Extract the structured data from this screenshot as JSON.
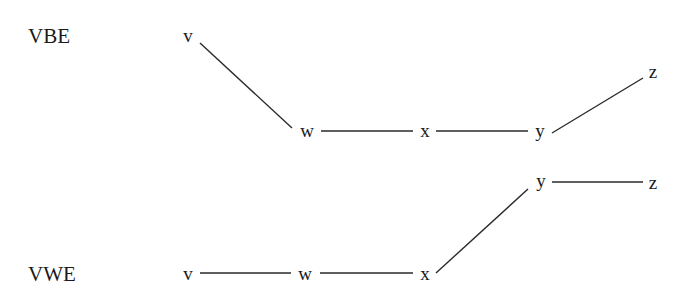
{
  "rows": [
    {
      "id": "vbe",
      "label": "VBE",
      "label_pos": {
        "x": 28,
        "y": 43
      },
      "nodes": [
        {
          "id": "v",
          "label": "v",
          "x": 188,
          "y": 42
        },
        {
          "id": "w",
          "label": "w",
          "x": 307,
          "y": 137
        },
        {
          "id": "x",
          "label": "x",
          "x": 425,
          "y": 137
        },
        {
          "id": "y",
          "label": "y",
          "x": 540,
          "y": 137
        },
        {
          "id": "z",
          "label": "z",
          "x": 653,
          "y": 78
        }
      ],
      "edges": [
        {
          "from": "v",
          "to": "w",
          "x1": 200,
          "y1": 43,
          "x2": 292,
          "y2": 128
        },
        {
          "from": "w",
          "to": "x",
          "x1": 321,
          "y1": 131,
          "x2": 413,
          "y2": 131
        },
        {
          "from": "x",
          "to": "y",
          "x1": 436,
          "y1": 131,
          "x2": 528,
          "y2": 131
        },
        {
          "from": "y",
          "to": "z",
          "x1": 552,
          "y1": 133,
          "x2": 643,
          "y2": 78
        }
      ]
    },
    {
      "id": "vwe",
      "label": "VWE",
      "label_pos": {
        "x": 28,
        "y": 281
      },
      "nodes": [
        {
          "id": "v",
          "label": "v",
          "x": 188,
          "y": 280
        },
        {
          "id": "w",
          "label": "w",
          "x": 305,
          "y": 280
        },
        {
          "id": "x",
          "label": "x",
          "x": 425,
          "y": 280
        },
        {
          "id": "y",
          "label": "y",
          "x": 541,
          "y": 187
        },
        {
          "id": "z",
          "label": "z",
          "x": 653,
          "y": 189
        }
      ],
      "edges": [
        {
          "from": "v",
          "to": "w",
          "x1": 200,
          "y1": 273,
          "x2": 291,
          "y2": 273
        },
        {
          "from": "w",
          "to": "x",
          "x1": 320,
          "y1": 273,
          "x2": 413,
          "y2": 273
        },
        {
          "from": "x",
          "to": "y",
          "x1": 436,
          "y1": 273,
          "x2": 528,
          "y2": 189
        },
        {
          "from": "y",
          "to": "z",
          "x1": 552,
          "y1": 182,
          "x2": 643,
          "y2": 182
        }
      ]
    }
  ]
}
